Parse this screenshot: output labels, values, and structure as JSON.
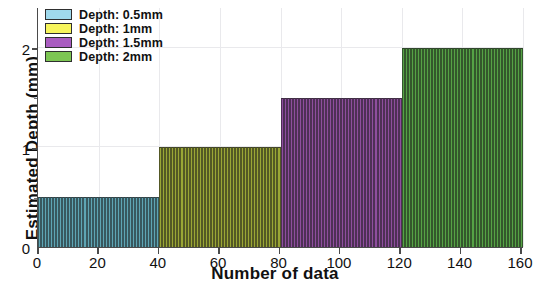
{
  "chart_data": {
    "type": "bar",
    "title": "",
    "subtitle": "",
    "xlabel": "Number of data",
    "ylabel": "Estimated Depth (mm)",
    "xlim": [
      0,
      160
    ],
    "ylim": [
      0,
      2.4
    ],
    "xticks": [
      0,
      20,
      40,
      60,
      80,
      100,
      120,
      140,
      160
    ],
    "xtick_labels": [
      "0",
      "20",
      "40",
      "60",
      "80",
      "100",
      "120",
      "140",
      "160"
    ],
    "yticks": [
      0,
      1,
      2
    ],
    "ytick_labels": [
      "0",
      "1",
      "2"
    ],
    "grid": true,
    "legend_position": "upper-left",
    "bar_count_per_series": 40,
    "series": [
      {
        "name": "Depth: 0.5mm",
        "color": "#5ea5b4",
        "legend_swatch_color": "#9fd9ec",
        "x_start": 0,
        "x_end": 40,
        "value": 0.5,
        "values": [
          0.5,
          0.5,
          0.5,
          0.5,
          0.5,
          0.5,
          0.5,
          0.5,
          0.5,
          0.5,
          0.5,
          0.5,
          0.5,
          0.5,
          0.5,
          0.5,
          0.5,
          0.5,
          0.5,
          0.5,
          0.5,
          0.5,
          0.5,
          0.5,
          0.5,
          0.5,
          0.5,
          0.5,
          0.5,
          0.5,
          0.5,
          0.5,
          0.5,
          0.5,
          0.5,
          0.5,
          0.5,
          0.5,
          0.5,
          0.5
        ]
      },
      {
        "name": "Depth: 1mm",
        "color": "#9aa635",
        "legend_swatch_color": "#f7f55c",
        "x_start": 40,
        "x_end": 80,
        "value": 1.0,
        "values": [
          1,
          1,
          1,
          1,
          1,
          1,
          1,
          1,
          1,
          1,
          1,
          1,
          1,
          1,
          1,
          1,
          1,
          1,
          1,
          1,
          1,
          1,
          1,
          1,
          1,
          1,
          1,
          1,
          1,
          1,
          1,
          1,
          1,
          1,
          1,
          1,
          1,
          1,
          1,
          1
        ]
      },
      {
        "name": "Depth: 1.5mm",
        "color": "#8e4e9e",
        "legend_swatch_color": "#a95cc0",
        "x_start": 80,
        "x_end": 120,
        "value": 1.5,
        "values": [
          1.5,
          1.5,
          1.5,
          1.5,
          1.5,
          1.5,
          1.5,
          1.5,
          1.5,
          1.5,
          1.5,
          1.5,
          1.5,
          1.5,
          1.5,
          1.5,
          1.5,
          1.5,
          1.5,
          1.5,
          1.5,
          1.5,
          1.5,
          1.5,
          1.5,
          1.5,
          1.5,
          1.5,
          1.5,
          1.5,
          1.5,
          1.5,
          1.5,
          1.5,
          1.5,
          1.5,
          1.5,
          1.5,
          1.5,
          1.5
        ]
      },
      {
        "name": "Depth: 2mm",
        "color": "#55a245",
        "legend_swatch_color": "#7dc653",
        "x_start": 120,
        "x_end": 160,
        "value": 2.0,
        "values": [
          2,
          2,
          2,
          2,
          2,
          2,
          2,
          2,
          2,
          2,
          2,
          2,
          2,
          2,
          2,
          2,
          2,
          2,
          2,
          2,
          2,
          2,
          2,
          2,
          2,
          2,
          2,
          2,
          2,
          2,
          2,
          2,
          2,
          2,
          2,
          2,
          2,
          2,
          2,
          2
        ]
      }
    ]
  },
  "axes": {
    "ylabel": "Estimated Depth (mm)",
    "xlabel": "Number of data",
    "ytick_0": "0",
    "ytick_1": "1",
    "ytick_2": "2",
    "xtick_0": "0",
    "xtick_20": "20",
    "xtick_40": "40",
    "xtick_60": "60",
    "xtick_80": "80",
    "xtick_100": "100",
    "xtick_120": "120",
    "xtick_140": "140",
    "xtick_160": "160"
  },
  "legend": {
    "items": [
      {
        "label": "Depth: 0.5mm"
      },
      {
        "label": "Depth: 1mm"
      },
      {
        "label": "Depth: 1.5mm"
      },
      {
        "label": "Depth: 2mm"
      }
    ]
  }
}
